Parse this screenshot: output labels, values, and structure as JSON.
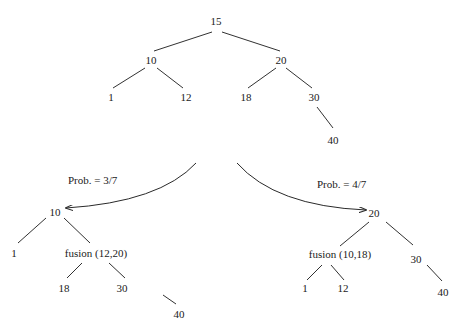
{
  "diagram": {
    "top_tree": {
      "nodes": [
        {
          "id": "t15",
          "label": "15",
          "x": 216,
          "y": 25
        },
        {
          "id": "t10",
          "label": "10",
          "x": 151,
          "y": 64
        },
        {
          "id": "t20",
          "label": "20",
          "x": 281,
          "y": 64
        },
        {
          "id": "t1",
          "label": "1",
          "x": 111,
          "y": 101
        },
        {
          "id": "t12",
          "label": "12",
          "x": 186,
          "y": 101
        },
        {
          "id": "t18",
          "label": "18",
          "x": 246,
          "y": 101
        },
        {
          "id": "t30",
          "label": "30",
          "x": 314,
          "y": 101
        },
        {
          "id": "t40",
          "label": "40",
          "x": 333,
          "y": 144
        }
      ],
      "edges": [
        [
          "t15",
          "t10"
        ],
        [
          "t15",
          "t20"
        ],
        [
          "t10",
          "t1"
        ],
        [
          "t10",
          "t12"
        ],
        [
          "t20",
          "t18"
        ],
        [
          "t20",
          "t30"
        ],
        [
          "t30",
          "t40"
        ]
      ]
    },
    "branches": [
      {
        "label": "Prob. = 3/7",
        "direction": "left"
      },
      {
        "label": "Prob. = 4/7",
        "direction": "right"
      }
    ],
    "left_tree": {
      "nodes": [
        {
          "id": "l10",
          "label": "10",
          "x": 55,
          "y": 216
        },
        {
          "id": "l1",
          "label": "1",
          "x": 14,
          "y": 257
        },
        {
          "id": "lf",
          "label": "fusion (12,20)",
          "x": 96,
          "y": 257
        },
        {
          "id": "l18",
          "label": "18",
          "x": 64,
          "y": 292
        },
        {
          "id": "l30",
          "label": "30",
          "x": 122,
          "y": 292
        },
        {
          "id": "l40",
          "label": "40",
          "x": 179,
          "y": 318
        }
      ]
    },
    "right_tree": {
      "nodes": [
        {
          "id": "r20",
          "label": "20",
          "x": 374,
          "y": 217
        },
        {
          "id": "rf",
          "label": "fusion (10,18)",
          "x": 340,
          "y": 258
        },
        {
          "id": "r30",
          "label": "30",
          "x": 416,
          "y": 263
        },
        {
          "id": "r1",
          "label": "1",
          "x": 305,
          "y": 292
        },
        {
          "id": "r12",
          "label": "12",
          "x": 343,
          "y": 292
        },
        {
          "id": "r40",
          "label": "40",
          "x": 443,
          "y": 296
        }
      ]
    }
  }
}
